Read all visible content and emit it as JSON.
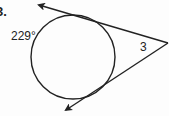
{
  "problem": {
    "number_label": "3.",
    "arc_label": "229°",
    "angle_label": "3"
  },
  "diagram": {
    "shapes": [
      "circle",
      "tangent-line-upper",
      "tangent-line-lower"
    ],
    "circle": {
      "cx": 73,
      "cy": 57,
      "r": 42
    },
    "vertex": {
      "x": 168,
      "y": 43
    },
    "upper_arrow_tip": {
      "x": 38,
      "y": 5
    },
    "lower_arrow_tip": {
      "x": 65,
      "y": 111
    },
    "stroke_color": "#222222"
  }
}
